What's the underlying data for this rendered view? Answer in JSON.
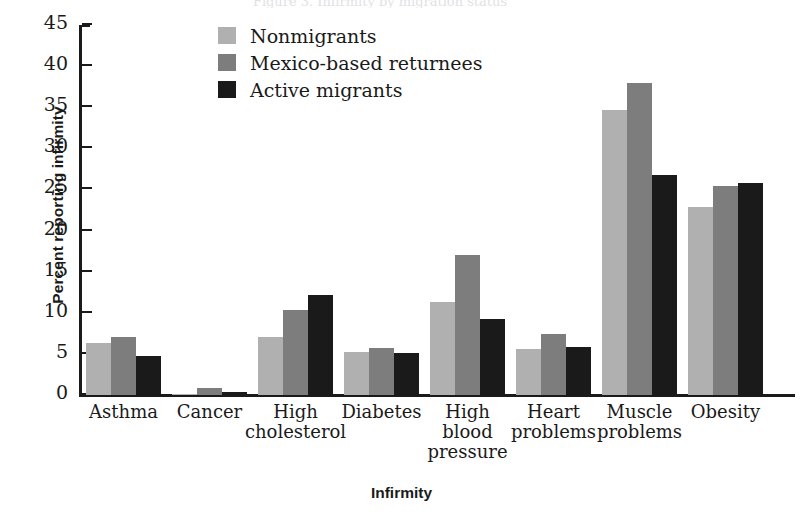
{
  "figure": {
    "cut_off_title": "Figure 3. Infirmity by migration status",
    "xlabel": "Infirmity",
    "ylabel": "Percent reporting infirmity"
  },
  "legend": {
    "position": "top-center",
    "items": [
      {
        "label": "Nonmigrants",
        "color": "#b0b0b0"
      },
      {
        "label": "Mexico-based returnees",
        "color": "#7d7d7d"
      },
      {
        "label": "Active migrants",
        "color": "#1a1a1a"
      }
    ]
  },
  "axis": {
    "yticks": [
      "0",
      "5",
      "10",
      "15",
      "20",
      "25",
      "30",
      "35",
      "40",
      "45"
    ]
  },
  "chart_data": {
    "type": "bar",
    "title": "Figure 3. Infirmity by migration status",
    "xlabel": "Infirmity",
    "ylabel": "Percent reporting infirmity",
    "ylim": [
      0,
      45
    ],
    "ytick_step": 5,
    "grid": false,
    "legend_position": "top-center",
    "categories": [
      "Asthma",
      "Cancer",
      "High cholesterol",
      "Diabetes",
      "High blood pressure",
      "Heart problems",
      "Muscle problems",
      "Obesity"
    ],
    "category_labels": [
      [
        "Asthma"
      ],
      [
        "Cancer"
      ],
      [
        "High",
        "cholesterol"
      ],
      [
        "Diabetes"
      ],
      [
        "High",
        "blood",
        "pressure"
      ],
      [
        "Heart",
        "problems"
      ],
      [
        "Muscle",
        "problems"
      ],
      [
        "Obesity"
      ]
    ],
    "series": [
      {
        "name": "Nonmigrants",
        "color": "#b0b0b0",
        "values": [
          6.3,
          0.1,
          7.0,
          5.2,
          11.3,
          5.6,
          34.7,
          22.9
        ]
      },
      {
        "name": "Mexico-based returnees",
        "color": "#7d7d7d",
        "values": [
          7.1,
          0.8,
          10.4,
          5.7,
          17.0,
          7.4,
          38.0,
          25.4
        ]
      },
      {
        "name": "Active migrants",
        "color": "#1a1a1a",
        "values": [
          4.7,
          0.35,
          12.2,
          5.1,
          9.3,
          5.9,
          26.7,
          25.8
        ]
      }
    ]
  }
}
